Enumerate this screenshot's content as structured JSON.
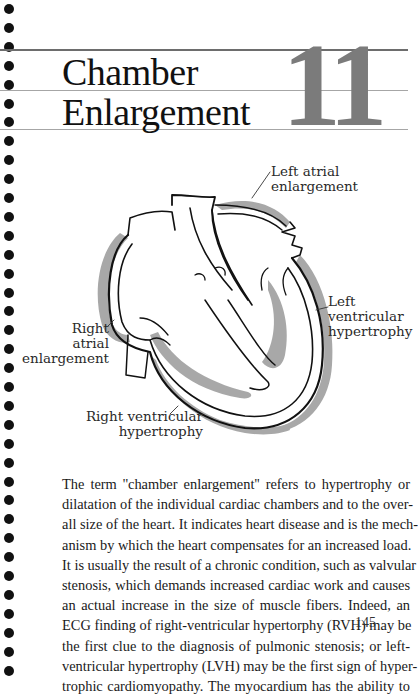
{
  "chapter": {
    "title_lines": [
      "Chamber",
      "Enlargement"
    ],
    "number": "11"
  },
  "figure": {
    "type": "heart-cross-section-diagram",
    "labels": {
      "left_atrial": "Left atrial\nenlargement",
      "left_ventricular": "Left\nventricular\nhypertrophy",
      "right_atrial": "Right\natrial\nenlargement",
      "right_ventricular": "Right ventricular\nhypertrophy"
    },
    "colors": {
      "outline": "#111111",
      "hypertrophy_shading": "#a8a8a8"
    }
  },
  "body": {
    "lines": [
      "The term ''chamber enlargement'' refers to hypertrophy or",
      "dilatation of the individual cardiac chambers and to the over-",
      "all size of the heart. It indicates heart disease and is the mech-",
      "anism by which the heart compensates for an increased load.",
      "It is usually the result of a chronic condition, such as valvular",
      "stenosis, which demands increased cardiac work and causes",
      "an actual increase in the size of muscle fibers. Indeed, an",
      "ECG finding of right-ventricular hypertorphy (RVH) may be",
      "the first clue to the diagnosis of pulmonic stenosis; or left-",
      "ventricular hypertrophy (LVH) may be the first sign of hyper-",
      "trophic cardiomyopathy. The myocardium has the ability to"
    ]
  },
  "page_number": "145",
  "binding": {
    "hole_count": 36,
    "hole_spacing_px": 18.9
  }
}
